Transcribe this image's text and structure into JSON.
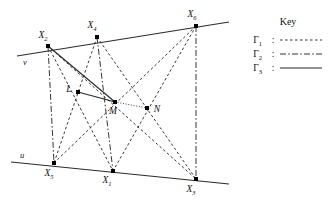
{
  "figure": {
    "title": "",
    "stroke_color": "#2b2b2b",
    "point_color": "#000000",
    "lines": {
      "u": {
        "label": "u",
        "label_x": 20,
        "label_y": 158,
        "x1": 11,
        "y1": 162,
        "x2": 229,
        "y2": 184
      },
      "v": {
        "label": "v",
        "label_x": 23,
        "label_y": 65,
        "x1": 17,
        "y1": 56,
        "x2": 229,
        "y2": 22
      }
    },
    "points": [
      {
        "id": "X1",
        "base": "X",
        "sub": "1",
        "x": 113,
        "y": 171,
        "label_x": 107,
        "label_y": 183,
        "label_anchor": "middle"
      },
      {
        "id": "X2",
        "base": "X",
        "sub": "2",
        "x": 48,
        "y": 46,
        "label_x": 43,
        "label_y": 38,
        "label_anchor": "middle"
      },
      {
        "id": "X3",
        "base": "X",
        "sub": "3",
        "x": 196,
        "y": 179,
        "label_x": 191,
        "label_y": 192,
        "label_anchor": "middle"
      },
      {
        "id": "X4",
        "base": "X",
        "sub": "4",
        "x": 97,
        "y": 37,
        "label_x": 92,
        "label_y": 28,
        "label_anchor": "middle"
      },
      {
        "id": "X5",
        "base": "X",
        "sub": "5",
        "x": 54,
        "y": 163,
        "label_x": 49,
        "label_y": 176,
        "label_anchor": "middle"
      },
      {
        "id": "X6",
        "base": "X",
        "sub": "6",
        "x": 196,
        "y": 26,
        "label_x": 192,
        "label_y": 17,
        "label_anchor": "middle"
      },
      {
        "id": "L",
        "base": "L",
        "sub": "",
        "x": 78,
        "y": 92,
        "label_x": 69,
        "label_y": 92,
        "label_anchor": "middle"
      },
      {
        "id": "M",
        "base": "M",
        "sub": "",
        "x": 115,
        "y": 102,
        "label_x": 113,
        "label_y": 114,
        "label_anchor": "middle"
      },
      {
        "id": "N",
        "base": "N",
        "sub": "",
        "x": 147,
        "y": 108,
        "label_x": 157,
        "label_y": 112,
        "label_anchor": "middle"
      }
    ],
    "segments": [
      {
        "name": "X2-X1",
        "from": "X2",
        "to": "X1",
        "style": "gamma1"
      },
      {
        "name": "X2-X3",
        "from": "X2",
        "to": "X3",
        "style": "gamma1"
      },
      {
        "name": "X4-X5",
        "from": "X4",
        "to": "X5",
        "style": "gamma1"
      },
      {
        "name": "X4-X3",
        "from": "X4",
        "to": "X3",
        "style": "gamma1"
      },
      {
        "name": "X6-X5",
        "from": "X6",
        "to": "X5",
        "style": "gamma1"
      },
      {
        "name": "X6-X1",
        "from": "X6",
        "to": "X1",
        "style": "gamma1"
      },
      {
        "name": "X2-X5",
        "from": "X2",
        "to": "X5",
        "style": "gamma2"
      },
      {
        "name": "X4-X1",
        "from": "X4",
        "to": "X1",
        "style": "gamma2"
      },
      {
        "name": "X6-X3",
        "from": "X6",
        "to": "X3",
        "style": "gamma2"
      },
      {
        "name": "X2-M",
        "from": "X2",
        "to": "M",
        "style": "gamma3"
      },
      {
        "name": "L-M",
        "from": "L",
        "to": "M",
        "style": "gamma3"
      },
      {
        "name": "M-N",
        "from": "M",
        "to": "N",
        "style": "dotted"
      }
    ]
  },
  "key": {
    "title": "Key",
    "entries": [
      {
        "base": "Γ",
        "sub": "1",
        "separator": ":",
        "style": "gamma1"
      },
      {
        "base": "Γ",
        "sub": "2",
        "separator": ":",
        "style": "gamma2"
      },
      {
        "base": "Γ",
        "sub": "3",
        "separator": ":",
        "style": "gamma3"
      }
    ]
  }
}
